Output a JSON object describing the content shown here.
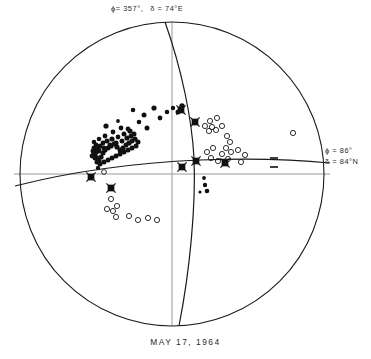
{
  "figure": {
    "caption": "MAY  17,  1964",
    "labels": {
      "top_plane": {
        "phi": "ϕ= 357°,",
        "delta": "δ = 74°E"
      },
      "right_plane": {
        "phi": "ϕ = 86°",
        "delta": "δ = 84°N"
      }
    },
    "colors": {
      "ink": "#1a1a1a",
      "axis_grey": "#9a9a9a",
      "background": "#ffffff"
    }
  },
  "chart_data": {
    "type": "scatter",
    "title": "MAY  17,  1964",
    "projection": "stereographic-equal-area-lower-hemisphere",
    "subtype": "fault-plane-solution",
    "xlabel": "",
    "ylabel": "",
    "xlim": [
      -1,
      1
    ],
    "ylim": [
      -1,
      1
    ],
    "grid": false,
    "legend_position": "none",
    "primitive_circle": {
      "cx": 172,
      "cy": 174,
      "r": 152
    },
    "axes": {
      "horizontal_line": {
        "x1": 14,
        "y1": 174,
        "x2": 330,
        "y2": 174,
        "color": "#9a9a9a"
      },
      "vertical_line": {
        "x1": 172,
        "y1": 22,
        "x2": 172,
        "y2": 326,
        "color": "#9a9a9a"
      }
    },
    "nodal_planes": [
      {
        "name": "plane-a",
        "strike_deg": 357,
        "dip_deg": 74,
        "dip_direction": "E",
        "label": "ϕ= 357°,  δ = 74°E",
        "path": "M 165 22 C 182 70 192 120 194 158 C 196 205 190 270 179 326"
      },
      {
        "name": "plane-b",
        "strike_deg": 86,
        "dip_deg": 84,
        "dip_direction": "N",
        "label": "ϕ = 86°  δ = 84°N",
        "path": "M 15 186 C 70 172 130 163 200 160 C 255 158 300 160 330 163"
      }
    ],
    "series": [
      {
        "name": "compressions",
        "marker": "filled-circle",
        "count": 74,
        "points": [
          [
            106,
            126,
            2.6
          ],
          [
            118,
            121,
            1.9
          ],
          [
            133,
            110,
            2.3
          ],
          [
            144,
            115,
            2.5
          ],
          [
            154,
            108,
            2.6
          ],
          [
            160,
            118,
            2.4
          ],
          [
            167,
            112,
            2.3
          ],
          [
            173,
            108,
            2.2
          ],
          [
            178,
            112,
            2.5
          ],
          [
            182,
            106,
            2.7
          ],
          [
            147,
            128,
            2.5
          ],
          [
            139,
            122,
            2.3
          ],
          [
            130,
            131,
            2.6
          ],
          [
            124,
            134,
            2.5
          ],
          [
            118,
            137,
            2.4
          ],
          [
            112,
            139,
            2.6
          ],
          [
            107,
            141,
            2.5
          ],
          [
            103,
            143,
            2.4
          ],
          [
            100,
            146,
            2.6
          ],
          [
            98,
            149,
            2.5
          ],
          [
            96,
            152,
            2.6
          ],
          [
            95,
            155,
            2.5
          ],
          [
            97,
            158,
            2.6
          ],
          [
            99,
            161,
            2.5
          ],
          [
            101,
            157,
            2.6
          ],
          [
            103,
            153,
            2.5
          ],
          [
            105,
            150,
            2.6
          ],
          [
            108,
            148,
            2.5
          ],
          [
            111,
            146,
            2.6
          ],
          [
            114,
            144,
            2.5
          ],
          [
            117,
            147,
            2.6
          ],
          [
            120,
            150,
            2.5
          ],
          [
            123,
            148,
            2.6
          ],
          [
            126,
            145,
            2.5
          ],
          [
            129,
            143,
            2.6
          ],
          [
            132,
            141,
            2.5
          ],
          [
            135,
            139,
            2.6
          ],
          [
            131,
            136,
            2.5
          ],
          [
            127,
            138,
            2.6
          ],
          [
            122,
            141,
            2.5
          ],
          [
            116,
            143,
            2.6
          ],
          [
            110,
            145,
            2.5
          ],
          [
            104,
            148,
            2.6
          ],
          [
            99,
            151,
            2.5
          ],
          [
            96,
            145,
            2.4
          ],
          [
            94,
            148,
            2.5
          ],
          [
            93,
            151,
            2.5
          ],
          [
            94,
            154,
            2.5
          ],
          [
            95,
            158,
            2.5
          ],
          [
            97,
            162,
            2.5
          ],
          [
            100,
            164,
            2.5
          ],
          [
            104,
            162,
            2.5
          ],
          [
            108,
            160,
            2.5
          ],
          [
            112,
            158,
            2.5
          ],
          [
            116,
            156,
            2.5
          ],
          [
            120,
            154,
            2.5
          ],
          [
            124,
            152,
            2.5
          ],
          [
            128,
            150,
            2.5
          ],
          [
            132,
            148,
            2.5
          ],
          [
            136,
            146,
            2.5
          ],
          [
            138,
            142,
            2.5
          ],
          [
            134,
            134,
            2.5
          ],
          [
            128,
            129,
            2.4
          ],
          [
            121,
            128,
            2.4
          ],
          [
            113,
            132,
            2.4
          ],
          [
            105,
            136,
            2.4
          ],
          [
            99,
            139,
            2.3
          ],
          [
            94,
            142,
            2.3
          ],
          [
            92,
            156,
            2.4
          ],
          [
            98,
            168,
            2.2
          ],
          [
            204,
            178,
            1.9
          ],
          [
            205,
            185,
            2.2
          ],
          [
            200,
            192,
            1.6
          ],
          [
            207,
            191,
            2.3
          ]
        ]
      },
      {
        "name": "dilatations",
        "marker": "open-circle",
        "count": 31,
        "points": [
          [
            210,
            121,
            2.6
          ],
          [
            217,
            118,
            2.6
          ],
          [
            205,
            126,
            2.6
          ],
          [
            212,
            127,
            2.6
          ],
          [
            209,
            131,
            2.6
          ],
          [
            216,
            130,
            2.6
          ],
          [
            222,
            126,
            2.6
          ],
          [
            227,
            136,
            2.6
          ],
          [
            230,
            142,
            2.6
          ],
          [
            226,
            148,
            2.6
          ],
          [
            231,
            152,
            2.6
          ],
          [
            238,
            150,
            2.6
          ],
          [
            245,
            155,
            2.6
          ],
          [
            211,
            158,
            2.6
          ],
          [
            218,
            161,
            2.6
          ],
          [
            241,
            162,
            2.6
          ],
          [
            293,
            133,
            2.6
          ],
          [
            111,
            199,
            2.6
          ],
          [
            107,
            209,
            2.6
          ],
          [
            113,
            211,
            2.6
          ],
          [
            117,
            206,
            2.6
          ],
          [
            116,
            217,
            2.6
          ],
          [
            129,
            216,
            2.6
          ],
          [
            138,
            220,
            2.6
          ],
          [
            148,
            218,
            2.6
          ],
          [
            157,
            220,
            2.6
          ],
          [
            104,
            172,
            2.4
          ],
          [
            228,
            159,
            2.6
          ],
          [
            222,
            154,
            2.6
          ],
          [
            213,
            148,
            2.6
          ],
          [
            207,
            152,
            2.6
          ]
        ]
      },
      {
        "name": "axes-markers",
        "marker": "x-in-square",
        "count": 7,
        "points": [
          [
            181,
            110
          ],
          [
            195,
            122
          ],
          [
            196,
            161
          ],
          [
            182,
            167
          ],
          [
            225,
            163
          ],
          [
            91,
            177
          ],
          [
            111,
            188
          ]
        ]
      },
      {
        "name": "emergent-dashes",
        "marker": "horizontal-dash",
        "count": 2,
        "points": [
          [
            274,
            158
          ],
          [
            274,
            167
          ]
        ]
      }
    ]
  }
}
